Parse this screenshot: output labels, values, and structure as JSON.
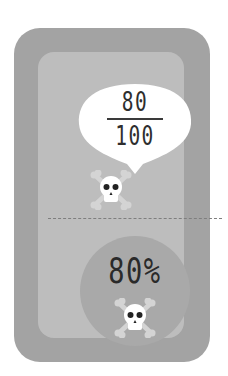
{
  "fraction": {
    "numerator": "80",
    "denominator": "100"
  },
  "percent": {
    "label": "80%"
  },
  "icons": {
    "top": "skull-crossbones-icon",
    "bottom": "skull-crossbones-icon"
  },
  "colors": {
    "card": "#a3a3a3",
    "panel": "#bdbdbd",
    "circle": "#a9a9a9",
    "bubble": "#ffffff",
    "bone": "#d4d4d4",
    "text": "#2e2e2e"
  }
}
